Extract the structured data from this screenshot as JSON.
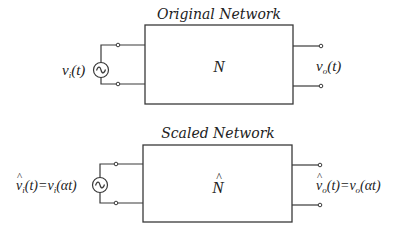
{
  "diagram": {
    "original": {
      "title": "Original Network",
      "block_label": "N",
      "input_label": {
        "base": "v",
        "sub": "i",
        "arg": "(t)"
      },
      "output_label": {
        "base": "v",
        "sub": "o",
        "arg": "(t)"
      },
      "source_symbol": "~"
    },
    "scaled": {
      "title": "Scaled Network",
      "block_label": "N",
      "block_hat": "^",
      "input_label": {
        "hat": "^",
        "base": "v",
        "sub": "i",
        "arg": "(t)=",
        "rhs_base": "v",
        "rhs_sub": "i",
        "rhs_arg": "(αt)"
      },
      "output_label": {
        "hat": "^",
        "base": "v",
        "sub": "o",
        "arg": "(t)=",
        "rhs_base": "v",
        "rhs_sub": "o",
        "rhs_arg": "(αt)"
      },
      "source_symbol": "~"
    },
    "colors": {
      "line": "#3a3a3a",
      "text": "#222222",
      "background": "#ffffff"
    }
  }
}
